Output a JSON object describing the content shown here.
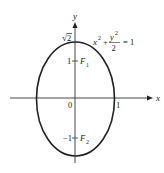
{
  "diagram": {
    "type": "ellipse-plot",
    "equation": {
      "lhs_x": "x",
      "lhs_x_exp": "2",
      "plus": "+",
      "frac_num": "y",
      "frac_num_exp": "2",
      "frac_den": "2",
      "rhs": "= 1"
    },
    "axes": {
      "x_label": "x",
      "y_label": "y"
    },
    "ticks": {
      "origin": "0",
      "x_one": "1",
      "y_one": "1",
      "y_neg_one": "−1",
      "y_sqrt2_radical": "√",
      "y_sqrt2_value": "2"
    },
    "foci": {
      "f1_label": "F",
      "f1_sub": "1",
      "f2_label": "F",
      "f2_sub": "2"
    },
    "colors": {
      "stroke": "#222222",
      "background": "#ffffff"
    }
  }
}
